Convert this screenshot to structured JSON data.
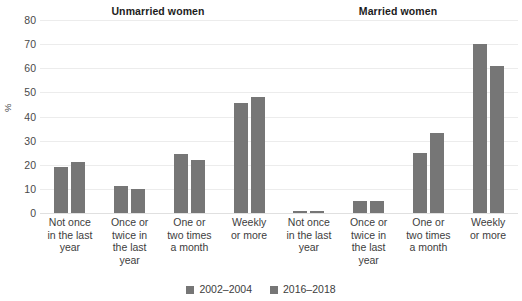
{
  "chart_data": {
    "type": "bar",
    "title": "",
    "xlabel": "",
    "ylabel": "%",
    "ylim": [
      0,
      80
    ],
    "yticks": [
      80,
      70,
      60,
      50,
      40,
      30,
      20,
      10,
      0
    ],
    "grid": true,
    "legend_position": "bottom-center",
    "series_colors": {
      "2002-2004": "#767676",
      "2016-2018": "#767676"
    },
    "panels": [
      {
        "title": "Unmarried women",
        "categories": [
          "Not once in the last year",
          "Once or twice in the last year",
          "One or two times a month",
          "Weekly or more"
        ],
        "series": [
          {
            "name": "2002–2004",
            "values": [
              19,
              11,
              24.5,
              45.5
            ]
          },
          {
            "name": "2016–2018",
            "values": [
              21,
              10,
              22,
              48
            ]
          }
        ]
      },
      {
        "title": "Married women",
        "categories": [
          "Not once in the last year",
          "Once or twice in the last year",
          "One or two times a month",
          "Weekly or more"
        ],
        "series": [
          {
            "name": "2002–2004",
            "values": [
              1,
              5,
              25,
              70
            ]
          },
          {
            "name": "2016–2018",
            "values": [
              1,
              5,
              33,
              61
            ]
          }
        ]
      }
    ],
    "category_lines": [
      [
        "Not once",
        "in the last",
        "year"
      ],
      [
        "Once or",
        "twice in",
        "the last",
        "year"
      ],
      [
        "One or",
        "two times",
        "a month"
      ],
      [
        "Weekly",
        "or more"
      ]
    ],
    "legend": [
      {
        "label": "2002–2004",
        "color": "#767676"
      },
      {
        "label": "2016–2018",
        "color": "#767676"
      }
    ]
  }
}
